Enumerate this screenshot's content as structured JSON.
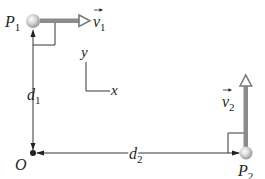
{
  "diagram": {
    "type": "physics-kinematics",
    "points": {
      "p1": {
        "label": "P",
        "subscript": "1"
      },
      "p2": {
        "label": "P",
        "subscript": "2"
      },
      "origin": {
        "label": "O"
      }
    },
    "velocities": {
      "v1": {
        "label": "v",
        "subscript": "1",
        "direction": "+x"
      },
      "v2": {
        "label": "v",
        "subscript": "2",
        "direction": "+y"
      }
    },
    "distances": {
      "d1": {
        "label": "d",
        "subscript": "1",
        "from": "O",
        "to": "P1"
      },
      "d2": {
        "label": "d",
        "subscript": "2",
        "from": "O",
        "to": "P2"
      }
    },
    "axes": {
      "x_label": "x",
      "y_label": "y"
    },
    "colors": {
      "ink": "#231f20",
      "velocity_arrow": "#8c8c8c",
      "particle": "#cfcfcf"
    }
  }
}
